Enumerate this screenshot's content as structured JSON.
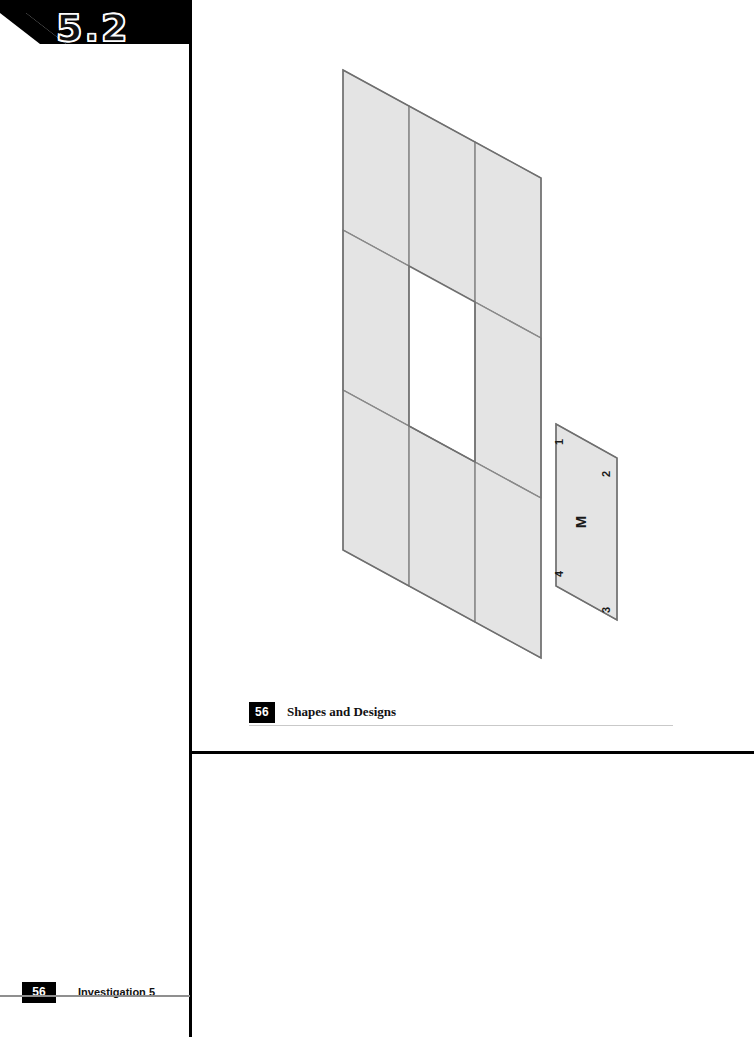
{
  "page": {
    "width": 754,
    "height": 1037,
    "background": "#ffffff"
  },
  "section_banner": {
    "label": "5.2",
    "banner_color": "#000000",
    "text_color": "#111111",
    "outline_color": "#ffffff"
  },
  "figure": {
    "name": "tiling-figure",
    "fill_color": "#e4e4e4",
    "line_color": "#8a8a8a",
    "grid": {
      "rows": 3,
      "columns": 3,
      "missing_cell": {
        "row": 2,
        "column": 2
      }
    },
    "sample_tile": {
      "center_label": "M",
      "corner_labels": [
        "1",
        "2",
        "3",
        "4"
      ]
    }
  },
  "chapter_foot": {
    "page_number": "56",
    "title": "Shapes and Designs",
    "chip_color": "#000000",
    "rule_color": "#c9c9c9"
  },
  "investigation_foot": {
    "page_number": "56",
    "title": "Investigation 5",
    "chip_color": "#000000",
    "rule_color": "#8f8f8f"
  },
  "rules": {
    "vertical_color": "#000000",
    "horizontal_color": "#000000"
  }
}
